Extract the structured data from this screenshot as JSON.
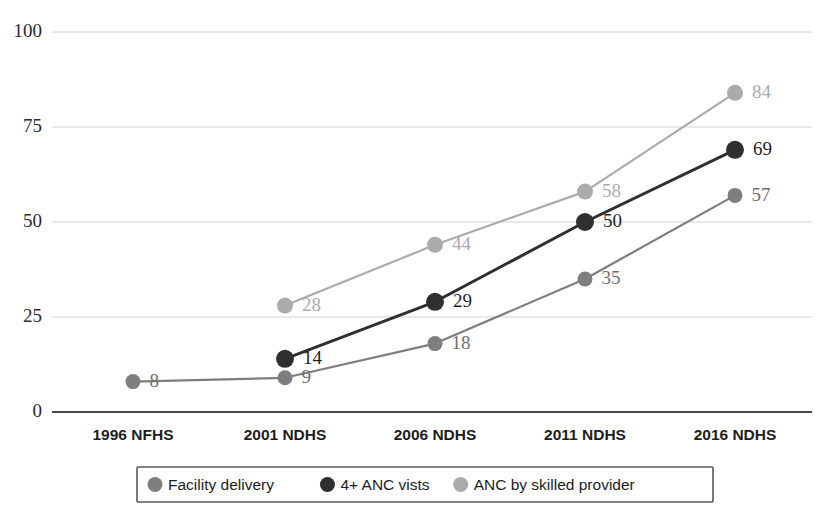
{
  "chart_data": {
    "type": "line",
    "title": "",
    "subtitle": "",
    "xlabel": "",
    "ylabel": "",
    "categories": [
      "1996 NFHS",
      "2001 NDHS",
      "2006 NDHS",
      "2011 NDHS",
      "2016 NDHS"
    ],
    "ylim": [
      0,
      100
    ],
    "yticks": [
      0,
      25,
      50,
      75,
      100
    ],
    "ytick_labels": [
      "0",
      "25",
      "50",
      "75",
      "100"
    ],
    "grid": true,
    "legend_position": "bottom",
    "series": [
      {
        "name": "Facility delivery",
        "color": "#7e7e7e",
        "values": [
          8,
          9,
          18,
          35,
          57
        ],
        "labels": [
          "8",
          "9",
          "18",
          "35",
          "57"
        ]
      },
      {
        "name": "4+ ANC vists",
        "color": "#2f2f2f",
        "values": [
          null,
          14,
          29,
          50,
          69
        ],
        "labels": [
          "",
          "14",
          "29",
          "50",
          "69"
        ]
      },
      {
        "name": "ANC by skilled provider",
        "color": "#ababab",
        "values": [
          null,
          28,
          44,
          58,
          84
        ],
        "labels": [
          "",
          "28",
          "44",
          "58",
          "84"
        ]
      }
    ]
  },
  "legend": {
    "items": [
      {
        "label": "Facility delivery",
        "color": "#7e7e7e",
        "marker": "circle-marker"
      },
      {
        "label": "4+ ANC vists",
        "color": "#2f2f2f",
        "marker": "circle-marker"
      },
      {
        "label": "ANC by skilled provider",
        "color": "#ababab",
        "marker": "circle-marker"
      }
    ]
  },
  "axis": {
    "y_labels": [
      "100",
      "75",
      "50",
      "25",
      "0"
    ],
    "x_labels": [
      "1996 NFHS",
      "2001 NDHS",
      "2006 NDHS",
      "2011 NDHS",
      "2016 NDHS"
    ]
  }
}
